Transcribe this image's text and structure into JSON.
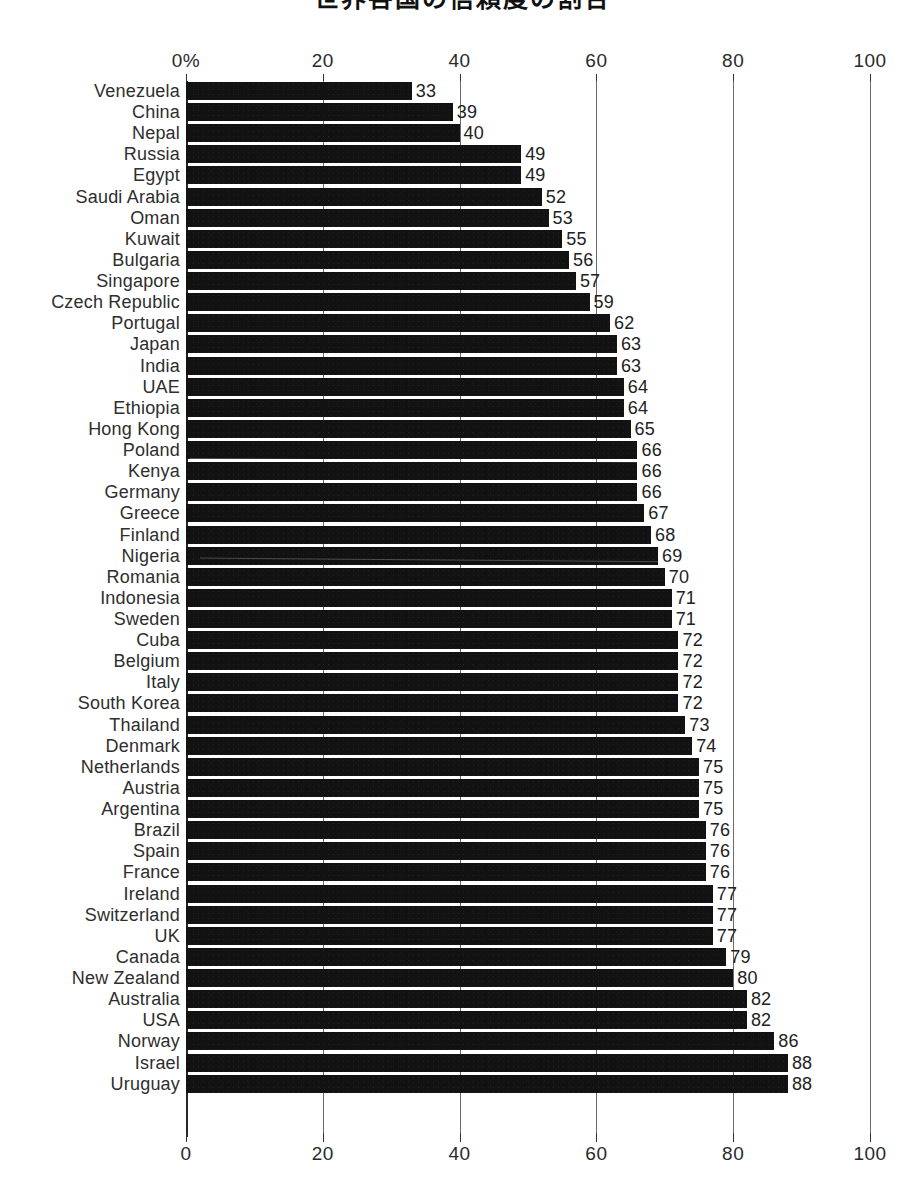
{
  "title": {
    "text": "世界各国の信頼度の割合",
    "note": "cropped-at-top"
  },
  "axis": {
    "top_ticks": [
      "0%",
      "20",
      "40",
      "60",
      "80",
      "100"
    ],
    "bottom_ticks": [
      "0",
      "20",
      "40",
      "60",
      "80",
      "100"
    ],
    "tick_values": [
      0,
      20,
      40,
      60,
      80,
      100
    ],
    "min": 0,
    "max": 100,
    "unit": "%"
  },
  "chart_data": {
    "type": "bar",
    "orientation": "horizontal",
    "title": "世界各国の信頼度の割合",
    "xlabel": "",
    "ylabel": "",
    "xlim": [
      0,
      100
    ],
    "grid": true,
    "legend": null,
    "value_labels": true,
    "categories": [
      "Venezuela",
      "China",
      "Nepal",
      "Russia",
      "Egypt",
      "Saudi Arabia",
      "Oman",
      "Kuwait",
      "Bulgaria",
      "Singapore",
      "Czech Republic",
      "Portugal",
      "Japan",
      "India",
      "UAE",
      "Ethiopia",
      "Hong Kong",
      "Poland",
      "Kenya",
      "Germany",
      "Greece",
      "Finland",
      "Nigeria",
      "Romania",
      "Indonesia",
      "Sweden",
      "Cuba",
      "Belgium",
      "Italy",
      "South Korea",
      "Thailand",
      "Denmark",
      "Netherlands",
      "Austria",
      "Argentina",
      "Brazil",
      "Spain",
      "France",
      "Ireland",
      "Switzerland",
      "UK",
      "Canada",
      "New Zealand",
      "Australia",
      "USA",
      "Norway",
      "Israel",
      "Uruguay"
    ],
    "values": [
      33,
      39,
      40,
      49,
      49,
      52,
      53,
      55,
      56,
      57,
      59,
      62,
      63,
      63,
      64,
      64,
      65,
      66,
      66,
      66,
      67,
      68,
      69,
      70,
      71,
      71,
      72,
      72,
      72,
      72,
      73,
      74,
      75,
      75,
      75,
      76,
      76,
      76,
      77,
      77,
      77,
      79,
      80,
      82,
      82,
      86,
      88,
      88
    ]
  },
  "colors": {
    "bar": "#121212",
    "gridline": "#6b6b6b",
    "axis": "#262626",
    "text": "#2e2e2e",
    "background": "#ffffff"
  }
}
